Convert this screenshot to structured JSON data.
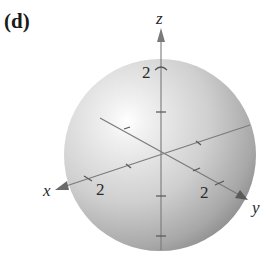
{
  "figure": {
    "panel_label": "(d)",
    "axes": {
      "x": {
        "label": "x",
        "tick_label": "2"
      },
      "y": {
        "label": "y",
        "tick_label": "2"
      },
      "z": {
        "label": "z",
        "tick_label": "2"
      }
    },
    "colors": {
      "sphere_light": "#f4f4f4",
      "sphere_mid": "#c8c8c8",
      "sphere_dark": "#8f8f8f",
      "axis": "#6a6a6a",
      "text": "#2a2a2a"
    }
  }
}
